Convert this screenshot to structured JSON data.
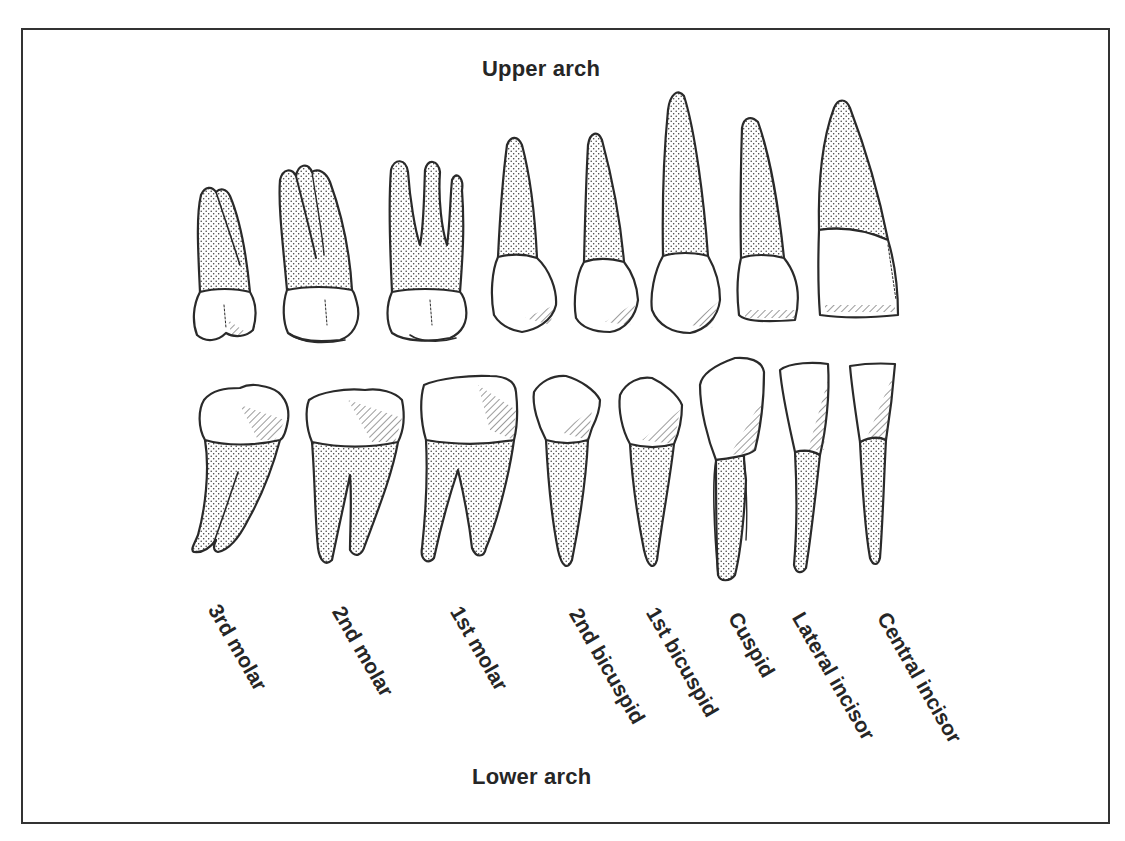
{
  "diagram": {
    "title_top": "Upper arch",
    "title_bottom": "Lower arch",
    "colors": {
      "outline": "#2a2a2a",
      "text": "#262626",
      "root_stipple": "#3a3a3a",
      "crown_fill": "#ffffff",
      "frame": "#333333"
    },
    "teeth": [
      {
        "name": "3rd molar",
        "position": 1,
        "upper_roots": 2,
        "lower_roots": 2
      },
      {
        "name": "2nd molar",
        "position": 2,
        "upper_roots": 3,
        "lower_roots": 2
      },
      {
        "name": "1st molar",
        "position": 3,
        "upper_roots": 3,
        "lower_roots": 2
      },
      {
        "name": "2nd bicuspid",
        "position": 4,
        "upper_roots": 1,
        "lower_roots": 1
      },
      {
        "name": "1st bicuspid",
        "position": 5,
        "upper_roots": 1,
        "lower_roots": 1
      },
      {
        "name": "Cuspid",
        "position": 6,
        "upper_roots": 1,
        "lower_roots": 1
      },
      {
        "name": "Lateral incisor",
        "position": 7,
        "upper_roots": 1,
        "lower_roots": 1
      },
      {
        "name": "Central incisor",
        "position": 8,
        "upper_roots": 1,
        "lower_roots": 1
      }
    ]
  }
}
